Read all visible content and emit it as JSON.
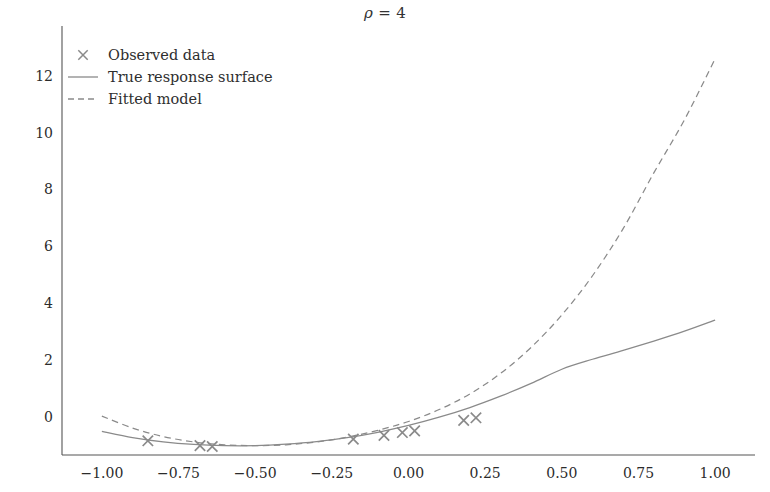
{
  "chart_data": {
    "type": "line",
    "title": "ρ = 4",
    "title_symbol": "ρ",
    "title_rest": " = 4",
    "xlabel": "",
    "ylabel": "",
    "xlim": [
      -1.13,
      1.13
    ],
    "ylim": [
      -1.35,
      13.4
    ],
    "xticks": [
      -1.0,
      -0.75,
      -0.5,
      -0.25,
      0.0,
      0.25,
      0.5,
      0.75,
      1.0
    ],
    "xticklabels": [
      "−1.00",
      "−0.75",
      "−0.50",
      "−0.25",
      "0.00",
      "0.25",
      "0.50",
      "0.75",
      "1.00"
    ],
    "yticks": [
      0,
      2,
      4,
      6,
      8,
      10,
      12
    ],
    "yticklabels": [
      "0",
      "2",
      "4",
      "6",
      "8",
      "10",
      "12"
    ],
    "grid": false,
    "spines": [
      "left",
      "bottom"
    ],
    "line_color": "#8a8a8a",
    "marker_color": "#8a8a8a",
    "text_color": "#2b2b2b",
    "series": [
      {
        "name": "True response surface",
        "style": "solid",
        "x": [
          -1.0,
          -0.9,
          -0.8,
          -0.7,
          -0.6,
          -0.5,
          -0.4,
          -0.3,
          -0.2,
          -0.1,
          0.0,
          0.1,
          0.2,
          0.3,
          0.4,
          0.5,
          0.6,
          0.7,
          0.8,
          0.9,
          1.0
        ],
        "y": [
          -0.52,
          -0.74,
          -0.89,
          -0.98,
          -1.02,
          -1.02,
          -0.97,
          -0.88,
          -0.74,
          -0.55,
          -0.31,
          -0.02,
          0.32,
          0.72,
          1.17,
          1.67,
          2.02,
          2.33,
          2.66,
          3.01,
          3.4
        ]
      },
      {
        "name": "Fitted model",
        "style": "dashed",
        "x": [
          -1.0,
          -0.9,
          -0.8,
          -0.7,
          -0.6,
          -0.5,
          -0.4,
          -0.3,
          -0.2,
          -0.1,
          0.0,
          0.1,
          0.2,
          0.3,
          0.4,
          0.5,
          0.6,
          0.7,
          0.8,
          0.9,
          1.0
        ],
        "y": [
          0.02,
          -0.4,
          -0.7,
          -0.89,
          -0.99,
          -1.02,
          -0.99,
          -0.89,
          -0.72,
          -0.48,
          -0.17,
          0.25,
          0.8,
          1.52,
          2.44,
          3.58,
          4.96,
          6.62,
          8.58,
          10.45,
          12.6
        ]
      }
    ],
    "scatter": {
      "name": "Observed data",
      "marker": "x",
      "x": [
        -0.85,
        -0.68,
        -0.64,
        -0.18,
        -0.08,
        -0.02,
        0.02,
        0.18,
        0.22
      ],
      "y": [
        -0.85,
        -1.02,
        -1.05,
        -0.79,
        -0.66,
        -0.56,
        -0.5,
        -0.13,
        -0.04
      ],
      "count": 9
    },
    "legend": {
      "position": "upper left",
      "frame": false,
      "entries": [
        {
          "label": "Observed data",
          "key": "marker-x"
        },
        {
          "label": "True response surface",
          "key": "line-solid"
        },
        {
          "label": "Fitted model",
          "key": "line-dashed"
        }
      ]
    }
  }
}
